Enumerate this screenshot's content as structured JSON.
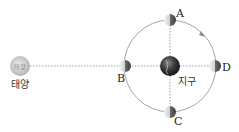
{
  "diagram": {
    "sun": {
      "label": "태양",
      "inner_text": "태양"
    },
    "earth": {
      "label": "지구"
    },
    "moon_positions": [
      {
        "id": "A",
        "label": "A",
        "where": "top"
      },
      {
        "id": "B",
        "label": "B",
        "where": "left"
      },
      {
        "id": "C",
        "label": "C",
        "where": "bottom"
      },
      {
        "id": "D",
        "label": "D",
        "where": "right"
      }
    ],
    "orbit_direction": "arrow-on-orbit",
    "colors": {
      "orbit": "#9a9a9a",
      "dotted_line": "#888888",
      "sun": "#c9c9c9",
      "earth": "#3a3a3a",
      "moon_light": "#e0e0e0",
      "moon_dark": "#555555"
    }
  }
}
